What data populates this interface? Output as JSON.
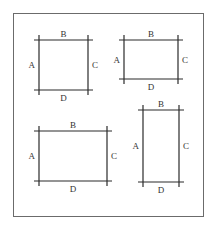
{
  "frame": {
    "x": 13,
    "y": 13,
    "w": 190,
    "h": 203,
    "stroke": "#6b6b6b"
  },
  "line_color": "#2a2a2a",
  "shapes": [
    {
      "id": "rect-1",
      "left": 39,
      "top": 40,
      "right": 88,
      "bottom": 90,
      "labels": {
        "top": "B",
        "left": "A",
        "right": "C",
        "bottom": "D"
      }
    },
    {
      "id": "rect-2",
      "left": 124,
      "top": 40,
      "right": 178,
      "bottom": 79,
      "labels": {
        "top": "B",
        "left": "A",
        "right": "C",
        "bottom": "D"
      }
    },
    {
      "id": "rect-3",
      "left": 39,
      "top": 131,
      "right": 107,
      "bottom": 181,
      "labels": {
        "top": "B",
        "left": "A",
        "right": "C",
        "bottom": "D"
      }
    },
    {
      "id": "rect-4",
      "left": 143,
      "top": 110,
      "right": 179,
      "bottom": 182,
      "labels": {
        "top": "B",
        "left": "A",
        "right": "C",
        "bottom": "D"
      }
    }
  ]
}
